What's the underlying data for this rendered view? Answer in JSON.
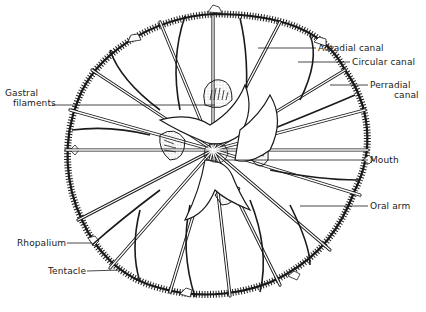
{
  "diagram": {
    "colors": {
      "ink": "#1a1a1a",
      "background": "#ffffff",
      "stipple": "#6a6a6a"
    },
    "labels": [
      {
        "id": "adradial-canal",
        "text": "Adradial canal",
        "x": 318,
        "y": 44
      },
      {
        "id": "circular-canal",
        "text": "Circular canal",
        "x": 352,
        "y": 58
      },
      {
        "id": "perradial-canal",
        "text": "Perradial",
        "text2": "canal",
        "x": 370,
        "y": 81
      },
      {
        "id": "gastral-filaments",
        "text": "Gastral",
        "text2": "filaments",
        "x": 5,
        "y": 88
      },
      {
        "id": "mouth",
        "text": "Mouth",
        "x": 370,
        "y": 156
      },
      {
        "id": "oral-arm",
        "text": "Oral arm",
        "x": 370,
        "y": 202
      },
      {
        "id": "rhopalium",
        "text": "Rhopalium",
        "x": 17,
        "y": 235
      },
      {
        "id": "tentacle",
        "text": "Tentacle",
        "x": 48,
        "y": 265
      }
    ]
  }
}
